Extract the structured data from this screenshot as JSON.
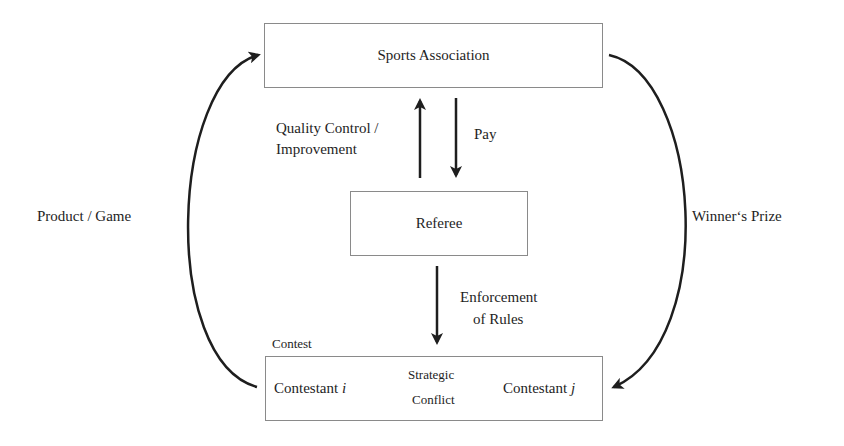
{
  "diagram": {
    "nodes": {
      "association": {
        "label": "Sports Association"
      },
      "referee": {
        "label": "Referee"
      },
      "contest": {
        "caption": "Contest",
        "contestant_i": {
          "prefix": "Contestant ",
          "var": "i"
        },
        "contestant_j": {
          "prefix": "Contestant ",
          "var": "j"
        }
      }
    },
    "edges": {
      "quality_control": {
        "line1": "Quality Control /",
        "line2": "Improvement"
      },
      "pay": {
        "label": "Pay"
      },
      "enforcement": {
        "line1": "Enforcement",
        "line2": "of Rules"
      },
      "strategic_conflict": {
        "line1": "Strategic",
        "line2": "Conflict"
      },
      "product_game": {
        "label": "Product / Game"
      },
      "winners_prize": {
        "label": "Winner‘s Prize"
      }
    },
    "colors": {
      "stroke": "#1e1e1e",
      "box_border": "#8a8a8a"
    }
  }
}
